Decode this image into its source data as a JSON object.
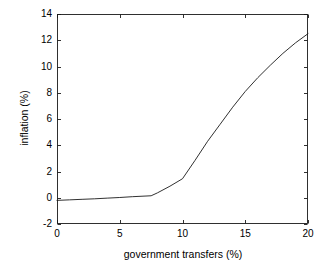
{
  "chart_data": {
    "type": "line",
    "title": "",
    "subtitle": "",
    "xlabel": "government transfers (%)",
    "ylabel": "inflation (%)",
    "xlim": [
      0,
      20
    ],
    "ylim": [
      -2,
      14
    ],
    "xticks": [
      0,
      5,
      10,
      15,
      20
    ],
    "yticks": [
      -2,
      0,
      2,
      4,
      6,
      8,
      10,
      12,
      14
    ],
    "xtick_labels": [
      "0",
      "5",
      "10",
      "15",
      "20"
    ],
    "ytick_labels": [
      "-2",
      "0",
      "2",
      "4",
      "6",
      "8",
      "10",
      "12",
      "14"
    ],
    "grid": false,
    "legend": null,
    "legend_position": "none",
    "annotations": [],
    "line_color": "#1a1a1a",
    "line_width": 0.9,
    "axes_color": "#1a1a1a",
    "background_color": "#ffffff",
    "series": [
      {
        "name": "inflation",
        "color": "#1a1a1a",
        "x": [
          0.0,
          1.0,
          2.0,
          3.0,
          4.0,
          5.0,
          6.0,
          7.5,
          8.0,
          9.0,
          10.0,
          11.0,
          12.0,
          13.0,
          14.0,
          15.0,
          16.0,
          17.0,
          18.0,
          19.0,
          20.0
        ],
        "y": [
          -0.2,
          -0.16,
          -0.12,
          -0.08,
          -0.03,
          0.02,
          0.08,
          0.15,
          0.37,
          0.88,
          1.45,
          2.85,
          4.3,
          5.6,
          6.9,
          8.1,
          9.15,
          10.1,
          11.0,
          11.8,
          12.5
        ]
      }
    ]
  },
  "figure": {
    "plot_left_px": 57,
    "plot_top_px": 14,
    "plot_right_px": 308,
    "plot_bottom_px": 224
  }
}
